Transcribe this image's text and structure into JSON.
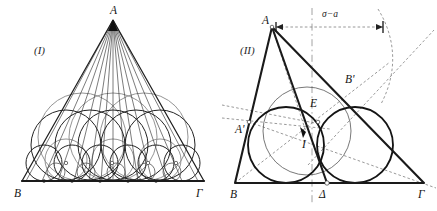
{
  "figure": {
    "background_color": "#ffffff",
    "ink_color": "#141414",
    "gray_color": "#8e8e8e",
    "width": 437,
    "height": 211
  },
  "panels": [
    {
      "id": "panel-1",
      "caption": "(I)",
      "description": "Isosceles triangle with apex cevian fan and a chain of tangent circles along the base",
      "vertices": [
        {
          "name": "A",
          "label": "A",
          "x": 113,
          "y": 20
        },
        {
          "name": "B",
          "label": "B",
          "x": 22,
          "y": 181
        },
        {
          "name": "G",
          "label": "Γ",
          "x": 204,
          "y": 181
        }
      ],
      "vertex_labels": [
        {
          "label": "A",
          "x": 110,
          "y": 14
        },
        {
          "label": "B",
          "x": 14,
          "y": 197
        },
        {
          "label": "Γ",
          "x": 196,
          "y": 197
        }
      ],
      "caption_pos": {
        "x": 34,
        "y": 54
      },
      "cevian_count": 12,
      "circle_rows": 3
    },
    {
      "id": "panel-2",
      "caption": "(II)",
      "description": "Scalene triangle with incircle, incenter I, tangency points and auxiliary dashed construction",
      "vertices": [
        {
          "name": "A",
          "label": "A",
          "x": 272,
          "y": 27
        },
        {
          "name": "B",
          "label": "B",
          "x": 235,
          "y": 183
        },
        {
          "name": "G",
          "label": "Γ",
          "x": 424,
          "y": 183
        }
      ],
      "vertex_labels": [
        {
          "label": "A",
          "x": 262,
          "y": 24
        },
        {
          "label": "B",
          "x": 230,
          "y": 198
        },
        {
          "label": "Γ",
          "x": 420,
          "y": 198
        }
      ],
      "points": [
        {
          "name": "A'",
          "label": "A'",
          "x": 249,
          "y": 122,
          "label_x": 237,
          "label_y": 133
        },
        {
          "name": "B'",
          "label": "B'",
          "x": 342,
          "y": 87,
          "label_x": 345,
          "label_y": 82
        },
        {
          "name": "E",
          "label": "E",
          "x": 318,
          "y": 110,
          "label_x": 312,
          "label_y": 108
        },
        {
          "name": "I",
          "label": "I",
          "x": 306,
          "y": 132,
          "label_x": 303,
          "label_y": 146
        },
        {
          "name": "D",
          "label": "Δ",
          "x": 327,
          "y": 183,
          "label_x": 320,
          "label_y": 198
        }
      ],
      "caption_pos": {
        "x": 240,
        "y": 54
      },
      "dimension": {
        "label": "σ−a",
        "label_x": 330,
        "label_y": 17,
        "y": 27,
        "x_start": 276,
        "x_end": 383
      },
      "incircle": {
        "cx": 307,
        "cy": 131,
        "r": 44
      },
      "circle_left": {
        "cx": 286,
        "cy": 145,
        "r": 38
      },
      "circle_right": {
        "cx": 355,
        "cy": 145,
        "r": 38
      },
      "axis_x": 312
    }
  ],
  "labels": {
    "panel_one": "(I)",
    "panel_two": "(II)",
    "vertex_a": "A",
    "vertex_b": "B",
    "vertex_gamma": "Γ",
    "point_a_prime": "A'",
    "point_b_prime": "B'",
    "point_e": "E",
    "point_i": "I",
    "point_delta": "Δ",
    "dimension_sigma_minus_a": "σ−a"
  }
}
